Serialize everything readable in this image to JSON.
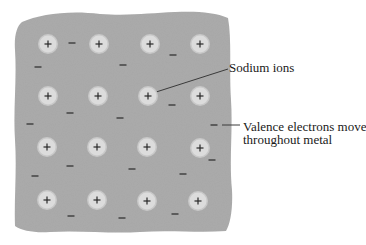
{
  "diagram": {
    "colors": {
      "metal": "#acacac",
      "ion_fill": "#dcdcdc",
      "ion_halo": "#c8c8c8",
      "ion_sign": "#2a2a2a",
      "electron": "#4a4a4a",
      "leader_line": "#3a3a3a",
      "text": "#1a1a1a",
      "background": "#ffffff"
    },
    "metal_outline": "M22,22 C40,14 70,10 100,14 C130,16 150,13 175,12 C195,11 215,12 228,18 C232,40 229,70 231,100 C233,130 229,160 232,190 C233,210 230,225 226,231 C200,233 170,230 140,232 C110,234 80,230 50,232 C35,233 22,231 15,226 C14,200 17,170 15,140 C13,110 17,80 15,50 C14,35 17,26 22,22 Z",
    "ion_sign": "+",
    "electron_sign": "−",
    "ions": [
      {
        "x": 48,
        "y": 44
      },
      {
        "x": 99,
        "y": 44
      },
      {
        "x": 150,
        "y": 44
      },
      {
        "x": 200,
        "y": 44
      },
      {
        "x": 48,
        "y": 96
      },
      {
        "x": 98,
        "y": 96
      },
      {
        "x": 148,
        "y": 96
      },
      {
        "x": 200,
        "y": 96
      },
      {
        "x": 47,
        "y": 147
      },
      {
        "x": 97,
        "y": 147
      },
      {
        "x": 147,
        "y": 147
      },
      {
        "x": 200,
        "y": 148
      },
      {
        "x": 47,
        "y": 200
      },
      {
        "x": 97,
        "y": 200
      },
      {
        "x": 147,
        "y": 201
      },
      {
        "x": 198,
        "y": 201
      }
    ],
    "electrons": [
      {
        "x": 72,
        "y": 43
      },
      {
        "x": 38,
        "y": 67
      },
      {
        "x": 123,
        "y": 65
      },
      {
        "x": 173,
        "y": 55
      },
      {
        "x": 30,
        "y": 124
      },
      {
        "x": 70,
        "y": 113
      },
      {
        "x": 120,
        "y": 118
      },
      {
        "x": 172,
        "y": 105
      },
      {
        "x": 214,
        "y": 125
      },
      {
        "x": 35,
        "y": 176
      },
      {
        "x": 70,
        "y": 166
      },
      {
        "x": 132,
        "y": 169
      },
      {
        "x": 183,
        "y": 174
      },
      {
        "x": 71,
        "y": 216
      },
      {
        "x": 122,
        "y": 218
      },
      {
        "x": 175,
        "y": 214
      },
      {
        "x": 212,
        "y": 160
      }
    ],
    "labels": {
      "sodium_ions": "Sodium ions",
      "valence_line1": "Valence electrons move",
      "valence_line2": "throughout metal"
    },
    "leaders": {
      "sodium_ions": {
        "x1": 153,
        "y1": 93,
        "x2": 228,
        "y2": 69
      },
      "valence": {
        "x1": 222,
        "y1": 125,
        "x2": 240,
        "y2": 125
      }
    }
  }
}
